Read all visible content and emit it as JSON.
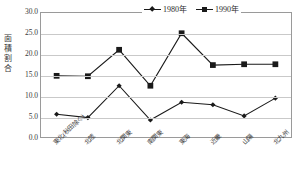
{
  "chart_data": {
    "type": "line",
    "title": "",
    "xlabel": "",
    "ylabel": "面積割合",
    "ylim": [
      0.0,
      30.0
    ],
    "ytick_step": 5.0,
    "ytick_labels": [
      "30.0",
      "25.0",
      "20.0",
      "15.0",
      "10.0",
      "5.0",
      "0.0"
    ],
    "ytick_values": [
      30.0,
      25.0,
      20.0,
      15.0,
      10.0,
      5.0,
      0.0
    ],
    "grid": true,
    "legend_position": "top-right",
    "categories": [
      "東北(秋田除く)",
      "北陸",
      "北関東",
      "南関東",
      "東海",
      "近畿",
      "山陽",
      "北九州"
    ],
    "series": [
      {
        "name": "1980年",
        "marker": "diamond",
        "color": "#1a1a1a",
        "values": [
          5.5,
          4.7,
          12.4,
          4.1,
          8.4,
          7.8,
          5.1,
          9.4
        ]
      },
      {
        "name": "1990年",
        "marker": "square",
        "color": "#1a1a1a",
        "values": [
          14.8,
          14.7,
          21.1,
          12.4,
          25.1,
          17.4,
          17.6,
          17.6
        ]
      }
    ]
  },
  "axes": {
    "y_title": "面積割合",
    "y_ticks": [
      "30.0",
      "25.0",
      "20.0",
      "15.0",
      "10.0",
      "5.0",
      "0.0"
    ]
  },
  "legend": {
    "entries": [
      {
        "label": "1980年",
        "marker": "diamond"
      },
      {
        "label": "1990年",
        "marker": "square"
      }
    ]
  },
  "colors": {
    "line": "#1a1a1a",
    "grid": "#c9c9c9",
    "frame": "#9a9a9a",
    "text": "#3a3a3a",
    "background": "#ffffff"
  }
}
